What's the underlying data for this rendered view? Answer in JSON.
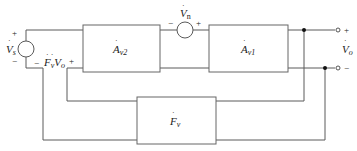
{
  "diagram": {
    "type": "block-diagram",
    "colors": {
      "wire": "#555555",
      "box": "#666666",
      "text": "#222222",
      "node": "#111111"
    },
    "source_vs": {
      "symbol": "V",
      "subscript": "s",
      "plus": "+",
      "minus": "−"
    },
    "source_vn": {
      "symbol": "V",
      "subscript": "n",
      "plus": "+",
      "minus": "−"
    },
    "feedback_voltage": {
      "minus": "−",
      "f_symbol": "F",
      "f_subscript": "v",
      "v_symbol": "V",
      "v_subscript": "o",
      "plus": "+"
    },
    "blocks": [
      {
        "id": "av2",
        "symbol": "A",
        "subscript": "v2"
      },
      {
        "id": "av1",
        "symbol": "A",
        "subscript": "v1"
      },
      {
        "id": "fv",
        "symbol": "F",
        "subscript": "v"
      }
    ],
    "output": {
      "symbol": "V",
      "subscript": "o",
      "plus": "+",
      "minus": "−"
    }
  }
}
